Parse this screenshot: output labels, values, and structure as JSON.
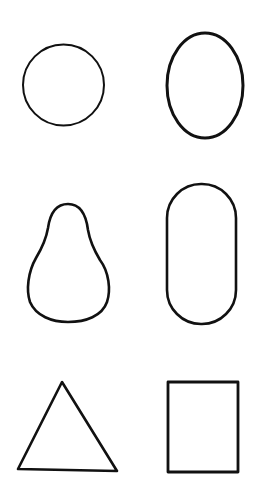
{
  "page": {
    "width": 258,
    "height": 498,
    "background": "#ffffff",
    "stroke_color": "#111111"
  },
  "shapes": [
    {
      "name": "circle",
      "row": 1,
      "column": 1,
      "cx": 63.5,
      "cy": 85,
      "r": 40.5,
      "stroke_width": 2
    },
    {
      "name": "oval",
      "row": 1,
      "column": 2,
      "cx": 205,
      "cy": 85.5,
      "rx": 38,
      "ry": 52.5,
      "stroke_width": 3
    },
    {
      "name": "pear",
      "row": 2,
      "column": 1,
      "bbox": [
        28,
        204,
        109,
        322
      ],
      "stroke_width": 2.6
    },
    {
      "name": "stadium",
      "row": 2,
      "column": 2,
      "x": 167,
      "y": 184,
      "width": 69,
      "height": 140,
      "rx": 34,
      "stroke_width": 2.6
    },
    {
      "name": "triangle",
      "row": 3,
      "column": 1,
      "points": [
        [
          62,
          382
        ],
        [
          18,
          469
        ],
        [
          117,
          471
        ]
      ],
      "stroke_width": 2.6
    },
    {
      "name": "rectangle",
      "row": 3,
      "column": 2,
      "x": 168,
      "y": 382,
      "width": 70,
      "height": 90,
      "stroke_width": 2.8
    }
  ]
}
